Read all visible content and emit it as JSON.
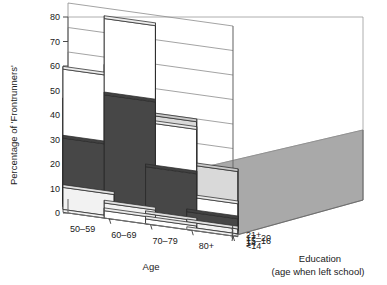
{
  "chart_data": {
    "type": "bar",
    "subtype": "3d-grouped-bar",
    "title": "",
    "xlabel": "Age",
    "zlabel": "Education",
    "zlabel_sub": "(age when left school)",
    "ylabel": "Percentage of 'Frontrunners'",
    "ylim": [
      0,
      80
    ],
    "yticks": [
      0,
      10,
      20,
      30,
      40,
      50,
      60,
      70,
      80
    ],
    "grid": true,
    "legend": "none",
    "categories": [
      "50–59",
      "60–69",
      "70–79",
      "80+"
    ],
    "series_axis_name": "Education (age when left school)",
    "series": [
      {
        "name": "<14",
        "values": [
          0,
          3,
          2,
          0
        ]
      },
      {
        "name": "14",
        "values": [
          9,
          5,
          3,
          2
        ]
      },
      {
        "name": "15–16",
        "values": [
          28,
          48,
          21,
          5
        ]
      },
      {
        "name": "17–20",
        "values": [
          55,
          78,
          38,
          10
        ]
      },
      {
        "name": "21+",
        "values": [
          41,
          57,
          40,
          22
        ]
      }
    ],
    "series_fills": [
      "#ffffff",
      "#f2f2f2",
      "#474747",
      "#ffffff",
      "#d9d9d9"
    ],
    "bar_fill_pattern": "alternating white and dark grey prisms",
    "colors": {
      "floor": "#a9a9a9",
      "wall": "#ffffff",
      "gridline": "#8c8c8c",
      "bar_white": "#ffffff",
      "bar_light": "#e6e6e6",
      "bar_dark": "#474747",
      "bar_mid": "#bdbdbd",
      "text": "#1a1a1a"
    }
  },
  "axes": {
    "y": {
      "title": "Percentage of 'Frontrunners'",
      "ticks": [
        "80",
        "70",
        "60",
        "50",
        "40",
        "30",
        "20",
        "10",
        "0"
      ]
    },
    "x": {
      "title": "Age",
      "ticks": [
        "50–59",
        "60–69",
        "70–79",
        "80+"
      ]
    },
    "z": {
      "title": "Education",
      "subtitle": "(age when left school)",
      "ticks": [
        "<14",
        "14",
        "15–16",
        "17–20",
        "21+"
      ]
    }
  }
}
